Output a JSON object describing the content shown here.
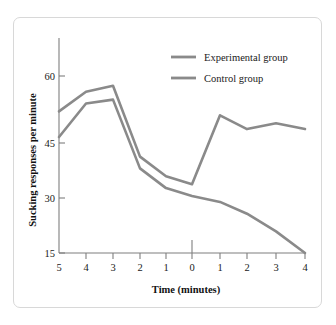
{
  "chart_data": {
    "type": "line",
    "title": "",
    "xlabel": "Time (minutes)",
    "ylabel": "Sucking responses per minute",
    "x": [
      -5,
      -4,
      -3,
      -2,
      -1,
      0,
      1,
      2,
      3,
      4
    ],
    "xtick_labels": [
      "5",
      "4",
      "3",
      "2",
      "1",
      "0",
      "1",
      "2",
      "3",
      "4"
    ],
    "ytick_labels": [
      "60",
      "45",
      "30",
      "15"
    ],
    "yticks": [
      60,
      45,
      30,
      15
    ],
    "ylim": [
      15,
      67
    ],
    "xlim": [
      -5,
      4
    ],
    "grid": false,
    "legend_position": "top-right",
    "series": [
      {
        "name": "Experimental group",
        "color": "#8a8a8a",
        "values": [
          51,
          56,
          57.5,
          39.5,
          34.5,
          32.5,
          50,
          46.5,
          48,
          46.5
        ]
      },
      {
        "name": "Control group",
        "color": "#8a8a8a",
        "values": [
          44.5,
          53,
          54,
          36.5,
          31.5,
          29.5,
          28,
          25,
          20.5,
          15
        ]
      }
    ],
    "annotations": [
      {
        "name": "zero-marker",
        "x": 0,
        "note": "vertical tick at time 0"
      }
    ]
  },
  "legend": {
    "items": [
      {
        "label": "Experimental group"
      },
      {
        "label": "Control group"
      }
    ]
  },
  "colors": {
    "line": "#8a8a8a",
    "axis": "#7f7f7f",
    "text": "#1a1a1a",
    "frame_border": "#d8d8d8",
    "background": "#ffffff"
  }
}
